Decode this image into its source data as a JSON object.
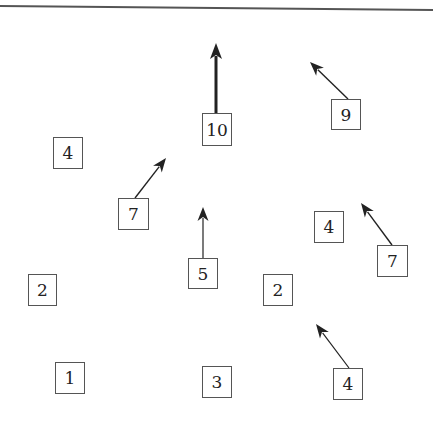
{
  "diagram": {
    "type": "vector-field grid",
    "top_rule": {
      "x1": 0,
      "y1": 6,
      "x2": 433,
      "y2": 10,
      "color": "#555555"
    },
    "nodes": [
      {
        "label": "10",
        "x": 202,
        "y": 113,
        "w": 30,
        "h": 33,
        "arrow": {
          "x1": 216,
          "y1": 113,
          "x2": 216,
          "y2": 43,
          "weight": 3
        }
      },
      {
        "label": "9",
        "x": 331,
        "y": 99,
        "w": 30,
        "h": 31,
        "arrow": {
          "x1": 348,
          "y1": 99,
          "x2": 310,
          "y2": 62,
          "weight": 1.4
        }
      },
      {
        "label": "4",
        "x": 53,
        "y": 137,
        "w": 30,
        "h": 32,
        "arrow": null
      },
      {
        "label": "7",
        "x": 118,
        "y": 198,
        "w": 31,
        "h": 32,
        "arrow": {
          "x1": 135,
          "y1": 198,
          "x2": 166,
          "y2": 158,
          "weight": 1.4
        }
      },
      {
        "label": "5",
        "x": 188,
        "y": 258,
        "w": 30,
        "h": 31,
        "arrow": {
          "x1": 203,
          "y1": 258,
          "x2": 203,
          "y2": 207,
          "weight": 1.2
        }
      },
      {
        "label": "4",
        "x": 314,
        "y": 211,
        "w": 30,
        "h": 32,
        "arrow": null
      },
      {
        "label": "7",
        "x": 377,
        "y": 245,
        "w": 31,
        "h": 32,
        "arrow": {
          "x1": 392,
          "y1": 245,
          "x2": 361,
          "y2": 203,
          "weight": 1.4
        }
      },
      {
        "label": "2",
        "x": 28,
        "y": 274,
        "w": 29,
        "h": 32,
        "arrow": null
      },
      {
        "label": "2",
        "x": 263,
        "y": 274,
        "w": 30,
        "h": 32,
        "arrow": null
      },
      {
        "label": "1",
        "x": 55,
        "y": 362,
        "w": 30,
        "h": 32,
        "arrow": null
      },
      {
        "label": "3",
        "x": 202,
        "y": 366,
        "w": 30,
        "h": 32,
        "arrow": null
      },
      {
        "label": "4",
        "x": 333,
        "y": 368,
        "w": 30,
        "h": 32,
        "arrow": {
          "x1": 349,
          "y1": 368,
          "x2": 316,
          "y2": 324,
          "weight": 1.2
        }
      }
    ],
    "colors": {
      "line": "#222222",
      "box_border": "#555555",
      "background": "#ffffff"
    }
  }
}
